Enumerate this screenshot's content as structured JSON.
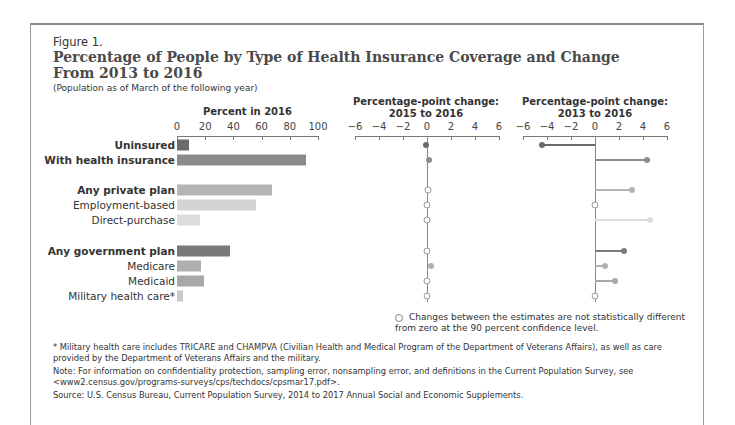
{
  "figure": {
    "label": "Figure 1.",
    "title": "Percentage of People by Type of Health Insurance Coverage and Change From 2013 to 2016",
    "subtitle": "(Population as of March of the following year)"
  },
  "panels": {
    "left_title": "Percent in 2016",
    "mid_title_1": "Percentage-point change:",
    "mid_title_2": "2015 to 2016",
    "right_title_1": "Percentage-point change:",
    "right_title_2": "2013 to 2016"
  },
  "legend": {
    "text": "Changes between the estimates are not statistically different from zero at the 90 percent confidence level."
  },
  "footnotes": {
    "military": "* Military health care includes TRICARE and CHAMPVA (Civilian Health and Medical Program of the Department of Veterans Affairs), as well as care provided by the Department of Veterans Affairs and the military.",
    "note": "Note: For information on confidentiality protection, sampling error, nonsampling error, and definitions in the Current Population Survey, see <www2.census.gov/programs-surveys/cps/techdocs/cpsmar17.pdf>.",
    "source": "Source: U.S. Census Bureau, Current Population Survey, 2014 to 2017 Annual Social and Economic Supplements."
  },
  "chart_data": [
    {
      "type": "bar",
      "orientation": "horizontal",
      "title": "Percent in 2016",
      "xlim": [
        0,
        100
      ],
      "xticks": [
        0,
        20,
        40,
        60,
        80,
        100
      ],
      "categories": [
        "Uninsured",
        "With health insurance",
        "Any private plan",
        "Employment-based",
        "Direct-purchase",
        "Any government plan",
        "Medicare",
        "Medicaid",
        "Military health care*"
      ],
      "values": [
        8.8,
        91.2,
        67.5,
        56.0,
        16.0,
        37.3,
        16.7,
        19.4,
        4.6
      ],
      "colors": [
        "#6b6b6b",
        "#8c8c8c",
        "#b4b4b4",
        "#d4d4d4",
        "#dcdcdc",
        "#7a7a7a",
        "#b0b0b0",
        "#a8a8a8",
        "#c8c8c8"
      ]
    },
    {
      "type": "scatter",
      "title": "Percentage-point change: 2015 to 2016",
      "xlim": [
        -6,
        6
      ],
      "xticks": [
        -6,
        -4,
        -2,
        0,
        2,
        4,
        6
      ],
      "categories": [
        "Uninsured",
        "With health insurance",
        "Any private plan",
        "Employment-based",
        "Direct-purchase",
        "Any government plan",
        "Medicare",
        "Medicaid",
        "Military health care*"
      ],
      "values": [
        -0.1,
        0.2,
        0.1,
        0.0,
        0.0,
        0.0,
        0.3,
        0.0,
        0.0
      ],
      "significant": [
        true,
        true,
        false,
        false,
        false,
        false,
        true,
        false,
        false
      ]
    },
    {
      "type": "scatter",
      "title": "Percentage-point change: 2013 to 2016",
      "xlim": [
        -6,
        6
      ],
      "xticks": [
        -6,
        -4,
        -2,
        0,
        2,
        4,
        6
      ],
      "categories": [
        "Uninsured",
        "With health insurance",
        "Any private plan",
        "Employment-based",
        "Direct-purchase",
        "Any government plan",
        "Medicare",
        "Medicaid",
        "Military health care*"
      ],
      "values": [
        -4.4,
        4.3,
        3.1,
        0.0,
        4.6,
        2.4,
        0.8,
        1.7,
        0.0
      ],
      "significant": [
        true,
        true,
        true,
        false,
        true,
        true,
        true,
        true,
        false
      ]
    }
  ]
}
